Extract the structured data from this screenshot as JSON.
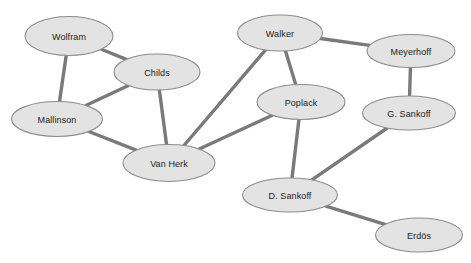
{
  "diagram": {
    "type": "node-link-network",
    "background_color": "#ffffff",
    "node_fill_color": "#e3e3e3",
    "node_stroke_color": "#8c8c8c",
    "edge_color": "#7a7a7a",
    "label_color": "#1c1c1c",
    "width": 471,
    "height": 263
  },
  "nodes": [
    {
      "id": "wolfram",
      "label": "Wolfram",
      "cx": 69,
      "cy": 36,
      "rx": 44,
      "ry": 19.5
    },
    {
      "id": "childs",
      "label": "Childs",
      "cx": 157,
      "cy": 72,
      "rx": 43,
      "ry": 18
    },
    {
      "id": "mallinson",
      "label": "Mallinson",
      "cx": 57,
      "cy": 119,
      "rx": 45.5,
      "ry": 17.5
    },
    {
      "id": "vanherk",
      "label": "Van Herk",
      "cx": 169,
      "cy": 163,
      "rx": 46,
      "ry": 18.5
    },
    {
      "id": "walker",
      "label": "Walker",
      "cx": 280,
      "cy": 33,
      "rx": 42.5,
      "ry": 18
    },
    {
      "id": "meyerhoff",
      "label": "Meyerhoff",
      "cx": 411,
      "cy": 51,
      "rx": 44,
      "ry": 16.5
    },
    {
      "id": "poplack",
      "label": "Poplack",
      "cx": 301,
      "cy": 102,
      "rx": 44,
      "ry": 17.5
    },
    {
      "id": "gsankoff",
      "label": "G. Sankoff",
      "cx": 409,
      "cy": 113,
      "rx": 46.5,
      "ry": 17
    },
    {
      "id": "dsankoff",
      "label": "D. Sankoff",
      "cx": 290,
      "cy": 195,
      "rx": 47.5,
      "ry": 17
    },
    {
      "id": "erdos",
      "label": "Erdös",
      "cx": 419,
      "cy": 235,
      "rx": 43.5,
      "ry": 17
    }
  ],
  "edges": [
    {
      "id": "wolfram-childs",
      "source": "wolfram",
      "target": "childs"
    },
    {
      "id": "wolfram-mallinson",
      "source": "wolfram",
      "target": "mallinson"
    },
    {
      "id": "childs-mallinson",
      "source": "childs",
      "target": "mallinson"
    },
    {
      "id": "childs-vanherk",
      "source": "childs",
      "target": "vanherk"
    },
    {
      "id": "mallinson-vanherk",
      "source": "mallinson",
      "target": "vanherk"
    },
    {
      "id": "walker-vanherk",
      "source": "walker",
      "target": "vanherk"
    },
    {
      "id": "walker-poplack",
      "source": "walker",
      "target": "poplack"
    },
    {
      "id": "walker-meyerhoff",
      "source": "walker",
      "target": "meyerhoff"
    },
    {
      "id": "poplack-vanherk",
      "source": "poplack",
      "target": "vanherk"
    },
    {
      "id": "poplack-dsankoff",
      "source": "poplack",
      "target": "dsankoff"
    },
    {
      "id": "meyerhoff-gsankoff",
      "source": "meyerhoff",
      "target": "gsankoff"
    },
    {
      "id": "gsankoff-dsankoff",
      "source": "gsankoff",
      "target": "dsankoff"
    },
    {
      "id": "dsankoff-erdos",
      "source": "dsankoff",
      "target": "erdos"
    }
  ]
}
